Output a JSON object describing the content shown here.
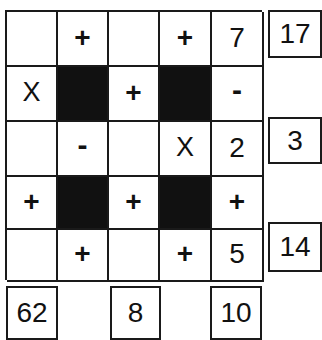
{
  "puzzle": {
    "type": "arithmetic-cross-math-grid",
    "rows": 5,
    "columns": 5,
    "colors": {
      "background": "#ffffff",
      "line": "#1a1a1a",
      "blocked_cell": "#111111",
      "text": "#111111"
    },
    "cells": [
      [
        {
          "kind": "blank",
          "text": ""
        },
        {
          "kind": "plus",
          "text": "+"
        },
        {
          "kind": "blank",
          "text": ""
        },
        {
          "kind": "plus",
          "text": "+"
        },
        {
          "kind": "number",
          "text": "7"
        }
      ],
      [
        {
          "kind": "times",
          "text": "X"
        },
        {
          "kind": "blocked",
          "text": ""
        },
        {
          "kind": "plus",
          "text": "+"
        },
        {
          "kind": "blocked",
          "text": ""
        },
        {
          "kind": "minus",
          "text": "-"
        }
      ],
      [
        {
          "kind": "blank",
          "text": ""
        },
        {
          "kind": "minus",
          "text": "-"
        },
        {
          "kind": "blank",
          "text": ""
        },
        {
          "kind": "times",
          "text": "X"
        },
        {
          "kind": "number",
          "text": "2"
        }
      ],
      [
        {
          "kind": "plus",
          "text": "+"
        },
        {
          "kind": "blocked",
          "text": ""
        },
        {
          "kind": "plus",
          "text": "+"
        },
        {
          "kind": "blocked",
          "text": ""
        },
        {
          "kind": "plus",
          "text": "+"
        }
      ],
      [
        {
          "kind": "blank",
          "text": ""
        },
        {
          "kind": "plus",
          "text": "+"
        },
        {
          "kind": "blank",
          "text": ""
        },
        {
          "kind": "plus",
          "text": "+"
        },
        {
          "kind": "number",
          "text": "5"
        }
      ]
    ],
    "row_answers": [
      {
        "row": 1,
        "text": "17"
      },
      {
        "row": 3,
        "text": "3"
      },
      {
        "row": 5,
        "text": "14"
      }
    ],
    "column_answers": [
      {
        "column": 1,
        "text": "62"
      },
      {
        "column": 3,
        "text": "8"
      },
      {
        "column": 5,
        "text": "10"
      }
    ]
  }
}
